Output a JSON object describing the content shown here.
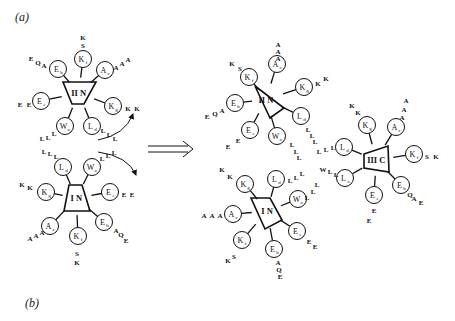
{
  "panels": {
    "a": "(a)",
    "b": "(b)"
  },
  "arrow": {
    "label": "⟹"
  },
  "complexes": [
    {
      "id": "left-IIN",
      "label": "II N",
      "tri": [
        [
          63,
          82
        ],
        [
          96,
          82
        ],
        [
          84,
          104
        ],
        [
          72,
          104
        ]
      ],
      "nodes": [
        {
          "name": "K",
          "sub": "f",
          "x": 83,
          "y": 59,
          "tail": [
            "S",
            "K"
          ],
          "tx": [
            83,
            83
          ],
          "ty": [
            45,
            37
          ]
        },
        {
          "name": "A",
          "sub": "c",
          "x": 105,
          "y": 70,
          "tail": [
            "A",
            "A",
            "A"
          ],
          "tx": [
            116,
            122,
            128
          ],
          "ty": [
            67,
            63,
            59
          ]
        },
        {
          "name": "E",
          "sub": "b",
          "x": 58,
          "y": 69,
          "tail": [
            "A",
            "Q",
            "E"
          ],
          "tx": [
            44,
            38,
            31
          ],
          "ty": [
            65,
            62,
            58
          ]
        },
        {
          "name": "E",
          "sub": "e",
          "x": 41,
          "y": 101,
          "tail": [
            "E",
            "E"
          ],
          "tx": [
            29,
            20
          ],
          "ty": [
            104,
            104
          ]
        },
        {
          "name": "K",
          "sub": "g",
          "x": 113,
          "y": 106,
          "tail": [
            "K",
            "K"
          ],
          "tx": [
            128,
            137
          ],
          "ty": [
            108,
            108
          ]
        },
        {
          "name": "W",
          "sub": "a",
          "x": 65,
          "y": 126,
          "tail": [
            "L",
            "L",
            "L"
          ],
          "tx": [
            54,
            48,
            42
          ],
          "ty": [
            133,
            137,
            138
          ]
        },
        {
          "name": "L",
          "sub": "d",
          "x": 92,
          "y": 126,
          "tail": [
            "L",
            "L",
            "L"
          ],
          "tx": [
            103,
            109,
            115
          ],
          "ty": [
            130,
            134,
            138
          ]
        }
      ]
    },
    {
      "id": "left-IN",
      "label": "I N",
      "tri": [
        [
          69,
          185
        ],
        [
          82,
          185
        ],
        [
          90,
          211
        ],
        [
          64,
          211
        ]
      ],
      "nodes": [
        {
          "name": "L",
          "sub": "d",
          "x": 63,
          "y": 167,
          "tail": [
            "L",
            "L",
            "L"
          ],
          "tx": [
            44,
            50,
            56
          ],
          "ty": [
            151,
            153,
            156
          ],
          "hideTail": false
        },
        {
          "name": "W",
          "sub": "a",
          "x": 92,
          "y": 167,
          "tail": [
            "L",
            "L",
            "L"
          ],
          "tx": [
            102,
            108,
            114
          ],
          "ty": [
            158,
            155,
            152
          ]
        },
        {
          "name": "K",
          "sub": "g",
          "x": 46,
          "y": 192,
          "tail": [
            "K",
            "K"
          ],
          "tx": [
            22,
            30
          ],
          "ty": [
            184,
            187
          ]
        },
        {
          "name": "E",
          "sub": "e",
          "x": 110,
          "y": 192,
          "tail": [
            "E",
            "E"
          ],
          "tx": [
            124,
            132
          ],
          "ty": [
            194,
            194
          ]
        },
        {
          "name": "A",
          "sub": "c",
          "x": 50,
          "y": 226,
          "tail": [
            "A",
            "A",
            "A"
          ],
          "tx": [
            30,
            36,
            42
          ],
          "ty": [
            238,
            235,
            232
          ]
        },
        {
          "name": "E",
          "sub": "b",
          "x": 104,
          "y": 222,
          "tail": [
            "A",
            "Q",
            "E"
          ],
          "tx": [
            116,
            121,
            126
          ],
          "ty": [
            230,
            234,
            240
          ]
        },
        {
          "name": "K",
          "sub": "f",
          "x": 78,
          "y": 236,
          "tail": [
            "S",
            "K"
          ],
          "tx": [
            77,
            77
          ],
          "ty": [
            253,
            262
          ]
        }
      ]
    },
    {
      "id": "right-IIN",
      "label": "II N",
      "tri": [
        [
          255,
          86
        ],
        [
          255,
          86
        ],
        [
          284,
          108
        ],
        [
          270,
          118
        ]
      ],
      "nodes": [
        {
          "name": "A",
          "sub": "c",
          "x": 277,
          "y": 64,
          "tail": [
            "A",
            "A",
            "A"
          ],
          "tx": [
            278,
            278,
            278
          ],
          "ty": [
            44,
            51,
            58
          ]
        },
        {
          "name": "K",
          "sub": "f",
          "x": 249,
          "y": 77,
          "tail": [
            "S",
            "K"
          ],
          "tx": [
            240,
            232
          ],
          "ty": [
            68,
            63
          ]
        },
        {
          "name": "K",
          "sub": "g",
          "x": 304,
          "y": 87,
          "tail": [
            "K",
            "K"
          ],
          "tx": [
            318,
            326
          ],
          "ty": [
            83,
            78
          ]
        },
        {
          "name": "E",
          "sub": "b",
          "x": 235,
          "y": 103,
          "tail": [
            "A",
            "Q",
            "E"
          ],
          "tx": [
            222,
            215,
            207
          ],
          "ty": [
            110,
            113,
            116
          ]
        },
        {
          "name": "L",
          "sub": "d",
          "x": 301,
          "y": 116,
          "tail": [
            "L",
            "L",
            "L"
          ],
          "tx": [
            308,
            312,
            315
          ],
          "ty": [
            129,
            135,
            141
          ]
        },
        {
          "name": "E",
          "sub": "e",
          "x": 250,
          "y": 130,
          "tail": [
            "E",
            "E"
          ],
          "tx": [
            238,
            228
          ],
          "ty": [
            140,
            146
          ]
        },
        {
          "name": "W",
          "sub": "a",
          "x": 277,
          "y": 136,
          "tail": [
            "L",
            "L",
            "L"
          ],
          "tx": [
            292,
            296,
            299
          ],
          "ty": [
            144,
            151,
            157
          ]
        }
      ]
    },
    {
      "id": "right-IN",
      "label": "I N",
      "tri": [
        [
          251,
          198
        ],
        [
          270,
          198
        ],
        [
          282,
          220
        ],
        [
          265,
          229
        ]
      ],
      "nodes": [
        {
          "name": "K",
          "sub": "g",
          "x": 245,
          "y": 184,
          "tail": [
            "K",
            "K"
          ],
          "tx": [
            222,
            230
          ],
          "ty": [
            169,
            176
          ]
        },
        {
          "name": "L",
          "sub": "d",
          "x": 276,
          "y": 179,
          "tail": [
            "L",
            "L",
            "L"
          ],
          "tx": [
            290,
            296,
            302
          ],
          "ty": [
            180,
            177,
            173
          ]
        },
        {
          "name": "W",
          "sub": "a",
          "x": 298,
          "y": 199,
          "tail": [
            "L",
            "L",
            "L"
          ],
          "tx": [
            307,
            313,
            317
          ],
          "ty": [
            197,
            191,
            184
          ]
        },
        {
          "name": "A",
          "sub": "c",
          "x": 233,
          "y": 214,
          "tail": [
            "A",
            "A",
            "A"
          ],
          "tx": [
            204,
            212,
            220
          ],
          "ty": [
            215,
            215,
            215
          ]
        },
        {
          "name": "E",
          "sub": "e",
          "x": 297,
          "y": 231,
          "tail": [
            "E",
            "E"
          ],
          "tx": [
            309,
            315
          ],
          "ty": [
            241,
            246
          ]
        },
        {
          "name": "K",
          "sub": "f",
          "x": 242,
          "y": 240,
          "tail": [
            "S",
            "K"
          ],
          "tx": [
            234,
            228
          ],
          "ty": [
            256,
            260
          ]
        },
        {
          "name": "E",
          "sub": "b",
          "x": 274,
          "y": 249,
          "tail": [
            "A",
            "Q",
            "E"
          ],
          "tx": [
            278,
            279,
            280
          ],
          "ty": [
            262,
            269,
            276
          ]
        }
      ]
    },
    {
      "id": "right-IIIC",
      "label": "III C",
      "tri": [
        [
          364,
          154
        ],
        [
          388,
          146
        ],
        [
          389,
          172
        ],
        [
          364,
          168
        ]
      ],
      "nodes": [
        {
          "name": "K",
          "sub": "g",
          "x": 367,
          "y": 125,
          "tail": [
            "K",
            "K"
          ],
          "tx": [
            352,
            358
          ],
          "ty": [
            105,
            112
          ]
        },
        {
          "name": "A",
          "sub": "c",
          "x": 396,
          "y": 127,
          "tail": [
            "A",
            "A",
            "A"
          ],
          "tx": [
            406,
            404,
            402
          ],
          "ty": [
            100,
            109,
            117
          ]
        },
        {
          "name": "L",
          "sub": "d",
          "x": 344,
          "y": 147,
          "tail": [
            "L",
            "L",
            "L"
          ],
          "tx": [
            319,
            326,
            333
          ],
          "ty": [
            151,
            149,
            147
          ]
        },
        {
          "name": "K",
          "sub": "f",
          "x": 414,
          "y": 154,
          "tail": [
            "S",
            "K"
          ],
          "tx": [
            427,
            436
          ],
          "ty": [
            156,
            156
          ]
        },
        {
          "name": "L",
          "sub": "a",
          "x": 345,
          "y": 178,
          "tail": [
            "W",
            "L",
            "L"
          ],
          "tx": [
            323,
            330,
            336
          ],
          "ty": [
            169,
            171,
            174
          ]
        },
        {
          "name": "E",
          "sub": "b",
          "x": 401,
          "y": 185,
          "tail": [
            "Q",
            "A",
            "E"
          ],
          "tx": [
            410,
            414,
            421
          ],
          "ty": [
            194,
            198,
            202
          ]
        },
        {
          "name": "E",
          "sub": "e",
          "x": 374,
          "y": 195,
          "tail": [
            "E",
            "E"
          ],
          "tx": [
            374,
            369
          ],
          "ty": [
            210,
            220
          ]
        }
      ]
    }
  ]
}
